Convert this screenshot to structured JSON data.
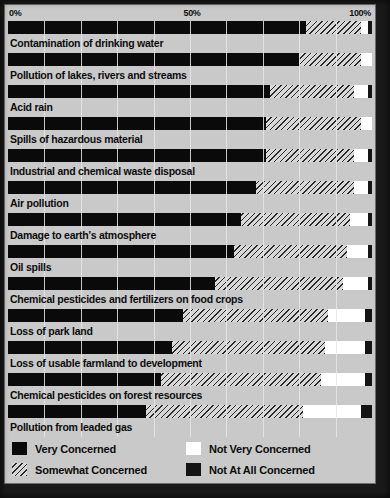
{
  "chart_data": {
    "type": "bar",
    "subtype": "100-percent-stacked-horizontal-bar",
    "title": "",
    "xlabel": "",
    "ylabel": "",
    "xlim": [
      0,
      100
    ],
    "xticks": [
      "0%",
      "50%",
      "100%"
    ],
    "xtick_values": [
      0,
      50,
      100
    ],
    "grid": true,
    "grid_interval": 10,
    "legend_position": "bottom",
    "legend": [
      "Very Concerned",
      "Not Very Concerned",
      "Somewhat Concerned",
      "Not At All Concerned"
    ],
    "categories": [
      "Contamination of drinking water",
      "Pollution of lakes, rivers and streams",
      "Acid rain",
      "Spills of hazardous material",
      "Industrial and chemical waste disposal",
      "Air pollution",
      "Damage to earth's atmosphere",
      "Oil spills",
      "Chemical pesticides and fertilizers on food crops",
      "Loss of park land",
      "Loss of usable farmland to development",
      "Chemical pesticides on forest resources",
      "Pollution from leaded gas"
    ],
    "series": [
      {
        "name": "Very Concerned",
        "color": "#0a0a0a",
        "values": [
          82,
          80,
          72,
          71,
          71,
          68,
          64,
          62,
          57,
          48,
          45,
          42,
          38
        ]
      },
      {
        "name": "Somewhat Concerned",
        "color": "#d2d2d2",
        "values": [
          15,
          17,
          23,
          26,
          24,
          27,
          30,
          31,
          35,
          40,
          42,
          44,
          43
        ]
      },
      {
        "name": "Not Very Concerned",
        "color": "#ffffff",
        "values": [
          2,
          3,
          4,
          3,
          4,
          4,
          5,
          6,
          7,
          10,
          11,
          12,
          16
        ]
      },
      {
        "name": "Not At All Concerned",
        "color": "#141414",
        "values": [
          1,
          0,
          1,
          0,
          1,
          1,
          1,
          1,
          1,
          2,
          2,
          2,
          3
        ]
      }
    ]
  },
  "axis": {
    "tick_0": "0%",
    "tick_50": "50%",
    "tick_100": "100%"
  },
  "legend": {
    "items": [
      {
        "label": "Very Concerned",
        "swatch": "swatch-very-concerned"
      },
      {
        "label": "Not Very Concerned",
        "swatch": "swatch-not-very-concerned"
      },
      {
        "label": "Somewhat Concerned",
        "swatch": "swatch-somewhat-concerned"
      },
      {
        "label": "Not At All Concerned",
        "swatch": "swatch-not-at-all-concerned"
      }
    ]
  },
  "rows": [
    {
      "label": "Contamination of drinking water",
      "very": 82,
      "somewhat": 15,
      "notvery": 2,
      "notatall": 1
    },
    {
      "label": "Pollution of lakes, rivers and streams",
      "very": 80,
      "somewhat": 17,
      "notvery": 3,
      "notatall": 0
    },
    {
      "label": "Acid rain",
      "very": 72,
      "somewhat": 23,
      "notvery": 4,
      "notatall": 1
    },
    {
      "label": "Spills of hazardous material",
      "very": 71,
      "somewhat": 26,
      "notvery": 3,
      "notatall": 0
    },
    {
      "label": "Industrial and chemical waste disposal",
      "very": 71,
      "somewhat": 24,
      "notvery": 4,
      "notatall": 1
    },
    {
      "label": "Air pollution",
      "very": 68,
      "somewhat": 27,
      "notvery": 4,
      "notatall": 1
    },
    {
      "label": "Damage to earth's atmosphere",
      "very": 64,
      "somewhat": 30,
      "notvery": 5,
      "notatall": 1
    },
    {
      "label": "Oil spills",
      "very": 62,
      "somewhat": 31,
      "notvery": 6,
      "notatall": 1
    },
    {
      "label": "Chemical pesticides and fertilizers on food crops",
      "very": 57,
      "somewhat": 35,
      "notvery": 7,
      "notatall": 1
    },
    {
      "label": "Loss of park land",
      "very": 48,
      "somewhat": 40,
      "notvery": 10,
      "notatall": 2
    },
    {
      "label": "Loss of usable farmland to development",
      "very": 45,
      "somewhat": 42,
      "notvery": 11,
      "notatall": 2
    },
    {
      "label": "Chemical pesticides on forest resources",
      "very": 42,
      "somewhat": 44,
      "notvery": 12,
      "notatall": 2
    },
    {
      "label": "Pollution from leaded gas",
      "very": 38,
      "somewhat": 43,
      "notvery": 16,
      "notatall": 3
    }
  ]
}
